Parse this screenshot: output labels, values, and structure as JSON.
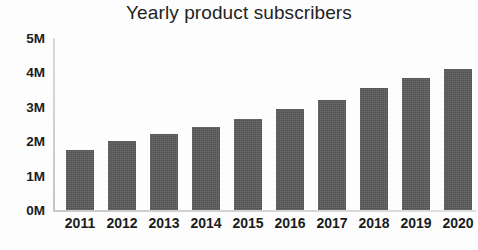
{
  "chart_data": {
    "type": "bar",
    "title": "Yearly product subscribers",
    "xlabel": "",
    "ylabel": "",
    "categories": [
      "2011",
      "2012",
      "2013",
      "2014",
      "2015",
      "2016",
      "2017",
      "2018",
      "2019",
      "2020"
    ],
    "values": [
      1.75,
      2.0,
      2.2,
      2.4,
      2.65,
      2.95,
      3.2,
      3.55,
      3.85,
      4.1
    ],
    "value_unit": "M",
    "ylim": [
      0,
      5
    ],
    "ytick_values": [
      0,
      1,
      2,
      3,
      4,
      5
    ],
    "ytick_labels": [
      "0M",
      "1M",
      "2M",
      "3M",
      "4M",
      "5M"
    ],
    "grid": false,
    "legend": null,
    "series": [
      {
        "name": "Subscribers",
        "color": "#5a5a5a",
        "values": [
          1.75,
          2.0,
          2.2,
          2.4,
          2.65,
          2.95,
          3.2,
          3.55,
          3.85,
          4.1
        ]
      }
    ],
    "colors": {
      "bar": "#5a5a5a",
      "title_text": "#232323",
      "tick_text": "#1c1c1c",
      "axis_line": "#d2d2d2",
      "background": "#fdfdfd"
    }
  }
}
